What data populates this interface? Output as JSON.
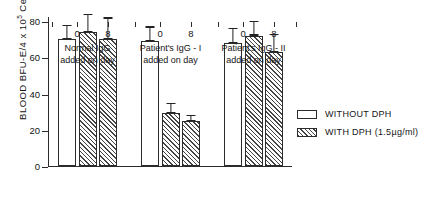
{
  "chart_data": {
    "type": "bar",
    "title": "",
    "xlabel": "",
    "ylabel": "BLOOD BFU-E/4 x 10^5 Cells",
    "ylabel_prefix": "BLOOD BFU-E/4 x 10",
    "ylabel_exponent": "5",
    "ylabel_suffix": " Cells",
    "ylim": [
      0,
      80
    ],
    "yticks": [
      0,
      20,
      40,
      60,
      80
    ],
    "ytick_labels": [
      "0",
      "20",
      "40",
      "60",
      "80"
    ],
    "grid": false,
    "legend_position": "right",
    "groups": [
      {
        "label_line1": "Normal IgG",
        "label_line2": "added on day",
        "xtick_labels": [
          "0",
          "8"
        ],
        "bars": [
          {
            "series": "WITHOUT DPH",
            "day": "0",
            "value": 70,
            "error": 4,
            "pattern": "open"
          },
          {
            "series": "WITH DPH (1.5µg/ml)",
            "day": "0",
            "value": 74,
            "error": 5,
            "pattern": "hatched"
          },
          {
            "series": "WITH DPH (1.5µg/ml)",
            "day": "8",
            "value": 70,
            "error": 6,
            "pattern": "hatched"
          }
        ]
      },
      {
        "label_line1": "Patient's IgG - I",
        "label_line2": "added on day",
        "xtick_labels": [
          "0",
          "8"
        ],
        "bars": [
          {
            "series": "WITHOUT DPH",
            "day": "0",
            "value": 69,
            "error": 4,
            "pattern": "open"
          },
          {
            "series": "WITH DPH (1.5µg/ml)",
            "day": "0",
            "value": 29,
            "error": 3,
            "pattern": "hatched"
          },
          {
            "series": "WITH DPH (1.5µg/ml)",
            "day": "8",
            "value": 25,
            "error": 1.5,
            "pattern": "hatched"
          }
        ]
      },
      {
        "label_line1": "Patient's IgG - II",
        "label_line2": "added on day",
        "xtick_labels": [
          "0",
          "8"
        ],
        "bars": [
          {
            "series": "WITHOUT DPH",
            "day": "0",
            "value": 68,
            "error": 4,
            "pattern": "open"
          },
          {
            "series": "WITH DPH (1.5µg/ml)",
            "day": "0",
            "value": 72,
            "error": 4,
            "pattern": "hatched"
          },
          {
            "series": "WITH DPH (1.5µg/ml)",
            "day": "8",
            "value": 63,
            "error": 5,
            "pattern": "hatched"
          }
        ]
      }
    ],
    "series": [
      {
        "name": "WITHOUT DPH",
        "pattern": "open"
      },
      {
        "name": "WITH DPH (1.5µg/ml)",
        "pattern": "hatched"
      }
    ]
  },
  "legend": {
    "items": [
      {
        "label": "WITHOUT DPH",
        "pattern": "open"
      },
      {
        "label": "WITH DPH (1.5µg/ml)",
        "pattern": "hatched"
      }
    ]
  }
}
